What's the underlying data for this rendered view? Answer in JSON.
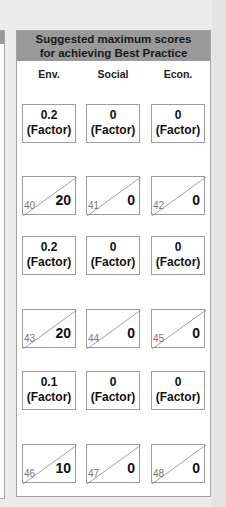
{
  "panel": {
    "title_line1": "Suggested maximum scores",
    "title_line2": "for achieving Best Practice",
    "header_color": "#999999",
    "columns": [
      "Env.",
      "Social",
      "Econ."
    ]
  },
  "rows": [
    {
      "factors": [
        {
          "value": "0.2",
          "unit": "(Factor)"
        },
        {
          "value": "0",
          "unit": "(Factor)"
        },
        {
          "value": "0",
          "unit": "(Factor)"
        }
      ],
      "scores": [
        {
          "number": "40",
          "value": "20"
        },
        {
          "number": "41",
          "value": "0"
        },
        {
          "number": "42",
          "value": "0"
        }
      ]
    },
    {
      "factors": [
        {
          "value": "0.2",
          "unit": "(Factor)"
        },
        {
          "value": "0",
          "unit": "(Factor)"
        },
        {
          "value": "0",
          "unit": "(Factor)"
        }
      ],
      "scores": [
        {
          "number": "43",
          "value": "20"
        },
        {
          "number": "44",
          "value": "0"
        },
        {
          "number": "45",
          "value": "0"
        }
      ]
    },
    {
      "factors": [
        {
          "value": "0.1",
          "unit": "(Factor)"
        },
        {
          "value": "0",
          "unit": "(Factor)"
        },
        {
          "value": "0",
          "unit": "(Factor)"
        }
      ],
      "scores": [
        {
          "number": "46",
          "value": "10"
        },
        {
          "number": "47",
          "value": "0"
        },
        {
          "number": "48",
          "value": "0"
        }
      ]
    }
  ]
}
